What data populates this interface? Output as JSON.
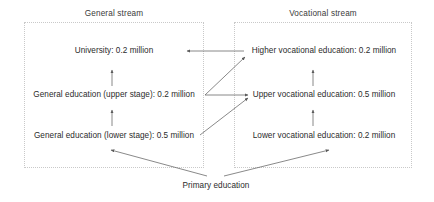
{
  "diagram": {
    "type": "flow-diagram",
    "title_general": "General stream",
    "title_vocational": "Vocational stream",
    "line_color": "#6b6b6b",
    "box_border_color": "#c9c9c9",
    "text_color": "#2b2b2b",
    "background": "#ffffff"
  },
  "nodes": {
    "university": "University: 0.2 million",
    "general_upper": "General education (upper stage): 0.2 million",
    "general_lower": "General education (lower stage): 0.5 million",
    "higher_vocational": "Higher vocational education: 0.2 million",
    "upper_vocational": "Upper vocational education: 0.5 million",
    "lower_vocational": "Lower vocational education: 0.2 million",
    "primary": "Primary education"
  },
  "flows": [
    {
      "from": "general_lower",
      "to": "general_upper",
      "style": "vertical-arrow"
    },
    {
      "from": "general_upper",
      "to": "university",
      "style": "vertical-arrow"
    },
    {
      "from": "lower_vocational",
      "to": "upper_vocational",
      "style": "vertical-arrow"
    },
    {
      "from": "upper_vocational",
      "to": "higher_vocational",
      "style": "vertical-arrow"
    },
    {
      "from": "higher_vocational",
      "to": "university",
      "style": "horizontal-arrow-left"
    },
    {
      "from": "general_upper",
      "to": "upper_vocational",
      "style": "horizontal-arrow-right"
    },
    {
      "from": "general_upper",
      "to": "higher_vocational",
      "style": "diagonal-arrow-up-right"
    },
    {
      "from": "general_lower",
      "to": "upper_vocational",
      "style": "diagonal-arrow-up-right"
    },
    {
      "from": "primary",
      "to": "general_lower",
      "style": "diagonal-arrow-up-left"
    },
    {
      "from": "primary",
      "to": "lower_vocational",
      "style": "diagonal-arrow-up-right"
    }
  ]
}
